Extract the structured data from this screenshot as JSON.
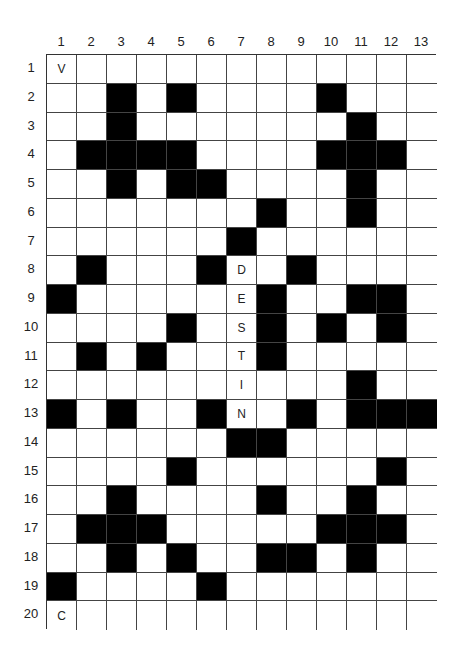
{
  "puzzle": {
    "type": "crossword-grid",
    "columns": 13,
    "rows": 20,
    "column_labels": [
      "1",
      "2",
      "3",
      "4",
      "5",
      "6",
      "7",
      "8",
      "9",
      "10",
      "11",
      "12",
      "13"
    ],
    "row_labels": [
      "1",
      "2",
      "3",
      "4",
      "5",
      "6",
      "7",
      "8",
      "9",
      "10",
      "11",
      "12",
      "13",
      "14",
      "15",
      "16",
      "17",
      "18",
      "19",
      "20"
    ],
    "black_cells": {
      "1": [],
      "2": [
        3,
        5,
        10
      ],
      "3": [
        3,
        11
      ],
      "4": [
        2,
        3,
        4,
        5,
        10,
        11,
        12
      ],
      "5": [
        3,
        5,
        6,
        11
      ],
      "6": [
        8,
        11
      ],
      "7": [
        7
      ],
      "8": [
        2,
        6,
        9
      ],
      "9": [
        1,
        8,
        11,
        12
      ],
      "10": [
        5,
        8,
        10,
        12
      ],
      "11": [
        2,
        4,
        8
      ],
      "12": [
        11
      ],
      "13": [
        1,
        3,
        6,
        9,
        11,
        12,
        13
      ],
      "14": [
        7,
        8
      ],
      "15": [
        5,
        12
      ],
      "16": [
        3,
        8,
        11
      ],
      "17": [
        2,
        3,
        4,
        10,
        11,
        12
      ],
      "18": [
        3,
        5,
        8,
        9,
        11
      ],
      "19": [
        1,
        6
      ],
      "20": []
    },
    "letters": [
      {
        "row": 1,
        "col": 1,
        "value": "V"
      },
      {
        "row": 8,
        "col": 7,
        "value": "D"
      },
      {
        "row": 9,
        "col": 7,
        "value": "E"
      },
      {
        "row": 10,
        "col": 7,
        "value": "S"
      },
      {
        "row": 11,
        "col": 7,
        "value": "T"
      },
      {
        "row": 12,
        "col": 7,
        "value": "I"
      },
      {
        "row": 13,
        "col": 7,
        "value": "N"
      },
      {
        "row": 20,
        "col": 1,
        "value": "C"
      }
    ],
    "colors": {
      "block": "#000000",
      "empty": "#ffffff",
      "gridline": "#444444"
    }
  }
}
